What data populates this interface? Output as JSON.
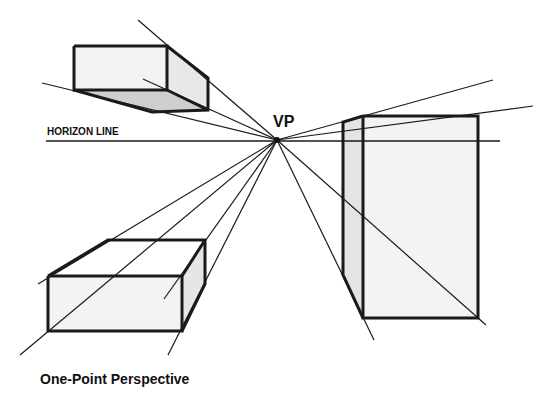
{
  "diagram": {
    "caption": "One-Point Perspective",
    "horizon_label": "HORIZON LINE",
    "vanishing_point_label": "VP",
    "colors": {
      "line": "#1a1a1a",
      "face_light": "#f2f2f2",
      "face_side": "#e4e4e4",
      "face_shadow": "#cfcfcf",
      "background": "#ffffff"
    },
    "objects": [
      {
        "name": "box-above-horizon-left",
        "description": "Box floating above horizon, underside visible"
      },
      {
        "name": "box-below-horizon-left",
        "description": "Box below horizon, top visible"
      },
      {
        "name": "tall-box-right",
        "description": "Tall box straddling horizon"
      }
    ]
  }
}
